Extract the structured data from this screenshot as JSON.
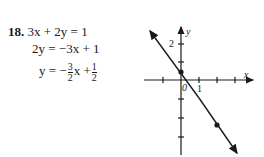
{
  "problem": {
    "number": "18.",
    "lines": [
      {
        "lhs": "3x + 2y",
        "rhs": "= 1"
      },
      {
        "lhs": "2y",
        "rhs": "= −3x + 1"
      },
      {
        "lhs": "y",
        "rhs_prefix": "= −",
        "frac1": {
          "num": "3",
          "den": "2"
        },
        "mid": "x +",
        "frac2": {
          "num": "1",
          "den": "2"
        }
      }
    ]
  },
  "graph": {
    "x_axis_label": "x",
    "y_axis_label": "y",
    "origin_label": "0",
    "x_tick_label": "1",
    "y_tick_label": "2",
    "points": [
      [
        0,
        0.5
      ],
      [
        2,
        -2.5
      ]
    ],
    "line": {
      "slope": -1.5,
      "intercept": 0.5
    }
  }
}
